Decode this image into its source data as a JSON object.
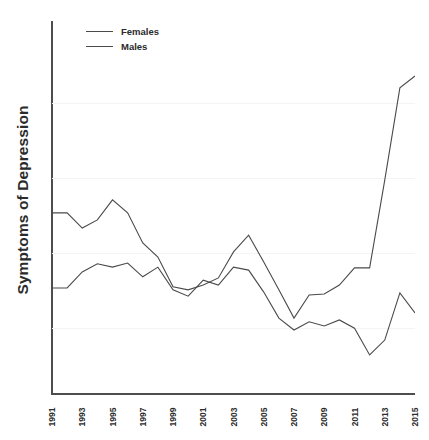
{
  "chart_data": {
    "type": "line",
    "title": "",
    "xlabel": "",
    "ylabel": "Symptoms of Depression",
    "grid": true,
    "legend_position": "top-left",
    "x": [
      1991,
      1992,
      1993,
      1994,
      1995,
      1996,
      1997,
      1998,
      1999,
      2000,
      2001,
      2002,
      2003,
      2004,
      2005,
      2006,
      2007,
      2008,
      2009,
      2010,
      2011,
      2012,
      2013,
      2014,
      2015
    ],
    "xtick_labels": [
      "1991",
      "1993",
      "1995",
      "1997",
      "1999",
      "2001",
      "2003",
      "2005",
      "2007",
      "2009",
      "2011",
      "2013",
      "2015"
    ],
    "xtick_years": [
      1991,
      1993,
      1995,
      1997,
      1999,
      2001,
      2003,
      2005,
      2007,
      2009,
      2011,
      2013,
      2015
    ],
    "xlim": [
      1991,
      2015
    ],
    "ylim": [
      0,
      100
    ],
    "ytick_labels": [],
    "gridline_values": [
      17.8,
      37.9,
      58.0,
      78.2
    ],
    "series": [
      {
        "name": "Females",
        "values": [
          48.7,
          48.7,
          44.6,
          46.8,
          52.2,
          48.7,
          40.6,
          36.8,
          28.8,
          28.0,
          29.3,
          31.2,
          38.2,
          42.7,
          35.5,
          28.0,
          20.4,
          26.6,
          26.9,
          29.3,
          33.9,
          33.9,
          57.5,
          82.3,
          85.5
        ]
      },
      {
        "name": "Males",
        "values": [
          28.5,
          28.5,
          32.8,
          35.0,
          34.1,
          35.2,
          31.5,
          34.1,
          28.0,
          26.3,
          30.6,
          29.3,
          34.1,
          33.3,
          27.4,
          20.4,
          17.2,
          19.4,
          18.3,
          19.9,
          17.7,
          10.5,
          14.5,
          27.2,
          21.8
        ]
      }
    ]
  },
  "legend": {
    "items": [
      {
        "label": "Females"
      },
      {
        "label": "Males"
      }
    ]
  },
  "axis": {
    "y_title": "Symptoms of Depression"
  }
}
